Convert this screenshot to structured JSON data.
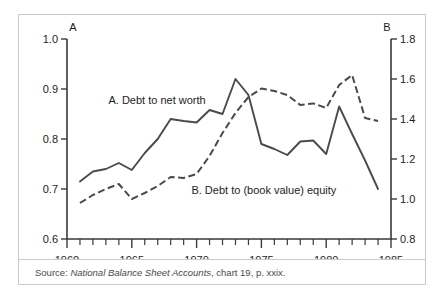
{
  "figure": {
    "left_axis_cap": "A",
    "right_axis_cap": "B",
    "source_prefix": "Source: ",
    "source_title": "National Balance Sheet Accounts",
    "source_suffix": ", chart 19, p. xxix."
  },
  "chart_data": {
    "type": "line",
    "title": "",
    "subtitle": "",
    "xlabel": "",
    "ylabel": "",
    "grid": false,
    "legend_position": "inline-annotation",
    "x": [
      1961,
      1962,
      1963,
      1964,
      1965,
      1966,
      1967,
      1968,
      1969,
      1970,
      1971,
      1972,
      1973,
      1974,
      1975,
      1976,
      1977,
      1978,
      1979,
      1980,
      1981,
      1982,
      1983,
      1984
    ],
    "xlim": [
      1960,
      1985
    ],
    "x_tick_labels": [
      "1960",
      "1965",
      "1970",
      "1975",
      "1980",
      "1985"
    ],
    "x_tick_values": [
      1960,
      1965,
      1970,
      1975,
      1980,
      1985
    ],
    "x_minor_tick_step": 1,
    "axes": [
      {
        "id": "left",
        "cap": "A",
        "ylim": [
          0.6,
          1.0
        ],
        "tick_labels": [
          "1.0",
          "0.9",
          "0.8",
          "0.7",
          "0.6"
        ],
        "tick_values": [
          1.0,
          0.9,
          0.8,
          0.7,
          0.6
        ]
      },
      {
        "id": "right",
        "cap": "B",
        "ylim": [
          0.8,
          1.8
        ],
        "tick_labels": [
          "1.8",
          "1.6",
          "1.4",
          "1.2",
          "1.0",
          "0.8"
        ],
        "tick_values": [
          1.8,
          1.6,
          1.4,
          1.2,
          1.0,
          0.8
        ]
      }
    ],
    "series": [
      {
        "name": "A.  Debt to net worth",
        "label": "A.  Debt to net worth",
        "axis": "left",
        "style": "solid",
        "color": "#4a4a4a",
        "label_x": 1963.2,
        "label_y": 0.878,
        "values": [
          0.715,
          0.735,
          0.74,
          0.752,
          0.738,
          0.772,
          0.8,
          0.84,
          0.836,
          0.833,
          0.858,
          0.85,
          0.92,
          0.888,
          0.79,
          0.78,
          0.768,
          0.795,
          0.797,
          0.77,
          0.865,
          0.81,
          0.757,
          0.7
        ]
      },
      {
        "name": "B.  Debt to (book value) equity",
        "label": "B.  Debt to (book value) equity",
        "axis": "right",
        "style": "dashed",
        "color": "#4a4a4a",
        "label_x": 1969.6,
        "label_y": 1.043,
        "values": [
          0.98,
          1.02,
          1.05,
          1.075,
          1.0,
          1.03,
          1.065,
          1.11,
          1.105,
          1.125,
          1.215,
          1.33,
          1.43,
          1.51,
          1.552,
          1.54,
          1.52,
          1.47,
          1.478,
          1.455,
          1.57,
          1.62,
          1.405,
          1.39
        ]
      }
    ]
  }
}
